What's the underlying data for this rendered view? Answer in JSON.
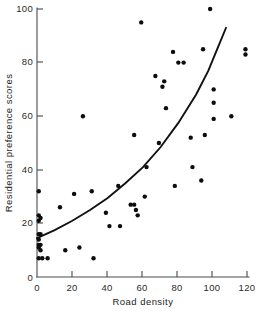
{
  "chart_data": {
    "type": "scatter",
    "title": "",
    "xlabel": "Road density",
    "ylabel": "Residential preference scores",
    "xlim": [
      0,
      120
    ],
    "ylim": [
      0,
      100
    ],
    "xticks": [
      0,
      20,
      40,
      60,
      80,
      100,
      120
    ],
    "xticklabels": [
      "0",
      "20",
      "40",
      "60",
      "80",
      "100",
      "120"
    ],
    "yticks": [
      0,
      20,
      40,
      60,
      80,
      100
    ],
    "yticklabels": [
      "0",
      "20",
      "40",
      "60",
      "80",
      "100"
    ],
    "grid": false,
    "legend": null,
    "marker": "filled-circle",
    "marker_color": "#0d0d0d",
    "curve_color": "#111111",
    "axis_color": "#4a4a4a",
    "points": [
      [
        1,
        32
      ],
      [
        1,
        23
      ],
      [
        1,
        21
      ],
      [
        2,
        22
      ],
      [
        1,
        16
      ],
      [
        2,
        16
      ],
      [
        1,
        14
      ],
      [
        1,
        12
      ],
      [
        2,
        12
      ],
      [
        1,
        11
      ],
      [
        2,
        10
      ],
      [
        1,
        7
      ],
      [
        3,
        7
      ],
      [
        6,
        7
      ],
      [
        13,
        26
      ],
      [
        16,
        10
      ],
      [
        21,
        31
      ],
      [
        24,
        11
      ],
      [
        26,
        60
      ],
      [
        31,
        32
      ],
      [
        32,
        7
      ],
      [
        39,
        24
      ],
      [
        41,
        19
      ],
      [
        46,
        34
      ],
      [
        47,
        19
      ],
      [
        53,
        27
      ],
      [
        55,
        27
      ],
      [
        55,
        53
      ],
      [
        56,
        25
      ],
      [
        57,
        23
      ],
      [
        59,
        95
      ],
      [
        61,
        30
      ],
      [
        62,
        41
      ],
      [
        67,
        75
      ],
      [
        69,
        50
      ],
      [
        71,
        71
      ],
      [
        72,
        73
      ],
      [
        73,
        63
      ],
      [
        77,
        84
      ],
      [
        78,
        34
      ],
      [
        80,
        80
      ],
      [
        83,
        80
      ],
      [
        87,
        52
      ],
      [
        88,
        41
      ],
      [
        93,
        36
      ],
      [
        94,
        85
      ],
      [
        95,
        53
      ],
      [
        98,
        100
      ],
      [
        100,
        70
      ],
      [
        100,
        65
      ],
      [
        100,
        59
      ],
      [
        110,
        60
      ],
      [
        118,
        85
      ],
      [
        118,
        83
      ]
    ],
    "fit_curve": {
      "description": "exponential trend line",
      "x_start": 0,
      "y_start": 14.5,
      "x_end": 107,
      "y_end": 93,
      "samples": [
        [
          0,
          14.5
        ],
        [
          10,
          17.5
        ],
        [
          20,
          21
        ],
        [
          30,
          25
        ],
        [
          40,
          29.5
        ],
        [
          50,
          35
        ],
        [
          60,
          41
        ],
        [
          70,
          48.5
        ],
        [
          80,
          57.5
        ],
        [
          90,
          68
        ],
        [
          97,
          77
        ],
        [
          102,
          85
        ],
        [
          107,
          93
        ]
      ]
    }
  },
  "axes": {
    "x_title": "Road density",
    "y_title": "Residential preference scores"
  }
}
